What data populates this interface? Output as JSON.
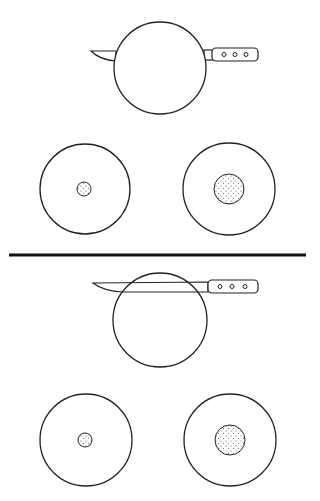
{
  "colors": {
    "background": "#ffffff",
    "stroke": "#222222",
    "divider": "#111111",
    "stipple": "#555555"
  },
  "panels": [
    {
      "name": "top-panel",
      "knife": {
        "position": "center",
        "blade_y": 51,
        "handle_y": 54,
        "rivets": 3
      },
      "main_circle": {
        "cx": 160,
        "cy": 68,
        "r": 46
      },
      "result_circles": [
        {
          "cx": 85,
          "cy": 189,
          "r": 45,
          "inner_r": 7
        },
        {
          "cx": 229,
          "cy": 189,
          "r": 46,
          "inner_r": 15
        }
      ]
    },
    {
      "name": "bottom-panel",
      "knife": {
        "position": "top",
        "blade_y": 284,
        "handle_y": 287,
        "rivets": 3
      },
      "main_circle": {
        "cx": 160,
        "cy": 320,
        "r": 47
      },
      "result_circles": [
        {
          "cx": 86,
          "cy": 440,
          "r": 46,
          "inner_r": 7
        },
        {
          "cx": 230,
          "cy": 440,
          "r": 46,
          "inner_r": 15
        }
      ]
    }
  ],
  "divider": {
    "x1": 9,
    "x2": 306,
    "y": 255,
    "thickness": 3
  }
}
